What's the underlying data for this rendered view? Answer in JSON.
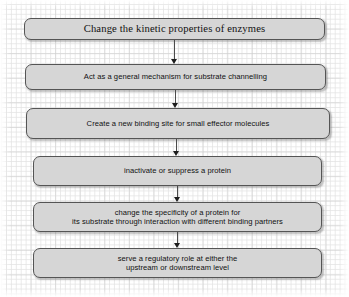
{
  "diagram": {
    "background": {
      "style": "graph-paper-grid",
      "page_color": "#ffffff",
      "grid_minor_color": "#e4e4e4",
      "grid_major_color": "#cdcdcd"
    },
    "node_style": {
      "fill": "#d6d6d6",
      "border": "#555555",
      "text": "#111111",
      "shape": "rounded-rectangle"
    },
    "connector_style": {
      "line": "#4a4a4a",
      "arrowhead": "#1d1d1d",
      "direction": "downward"
    },
    "nodes": [
      {
        "id": "node-1",
        "label": "Change the kinetic properties of enzymes",
        "font": "serif"
      },
      {
        "id": "node-2",
        "label": "Act as a general mechanism for substrate channelling",
        "font": "sans"
      },
      {
        "id": "node-3",
        "label": "Create a new binding site for small effector molecules",
        "font": "sans"
      },
      {
        "id": "node-4",
        "label": "inactivate or suppress a protein",
        "font": "sans"
      },
      {
        "id": "node-5",
        "label": "change the specificity of a protein for\nits substrate through interaction with different binding partners",
        "font": "sans"
      },
      {
        "id": "node-6",
        "label": "serve a regulatory role at either the\nupstream or downstream level",
        "font": "sans"
      }
    ],
    "connectors": [
      {
        "id": "conn-1",
        "from": "node-1",
        "to": "node-2",
        "icon": "down-arrow-icon"
      },
      {
        "id": "conn-2",
        "from": "node-2",
        "to": "node-3",
        "icon": "down-arrow-icon"
      },
      {
        "id": "conn-3",
        "from": "node-3",
        "to": "node-4",
        "icon": "down-arrow-icon"
      },
      {
        "id": "conn-4",
        "from": "node-4",
        "to": "node-5",
        "icon": "down-arrow-icon"
      },
      {
        "id": "conn-5",
        "from": "node-5",
        "to": "node-6",
        "icon": "down-arrow-icon"
      }
    ]
  }
}
